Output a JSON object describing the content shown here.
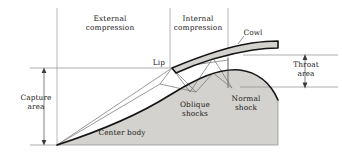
{
  "figure": {
    "type": "technical-diagram",
    "background_color": "#ffffff",
    "line_color": "#1a1a1a",
    "thin_line_color": "#6e6e6e",
    "fill_color": "#d4d2ce"
  },
  "labels": {
    "external_compression_line1": "External",
    "external_compression_line2": "compression",
    "internal_compression_line1": "Internal",
    "internal_compression_line2": "compression",
    "cowl": "Cowl",
    "lip": "Lip",
    "throat_area_line1": "Throat",
    "throat_area_line2": "area",
    "capture_area_line1": "Capture",
    "capture_area_line2": "area",
    "oblique_shocks_line1": "Oblique",
    "oblique_shocks_line2": "shocks",
    "normal_shock_line1": "Normal",
    "normal_shock_line2": "shock",
    "center_body": "Center body"
  },
  "geometry": {
    "baseline_y": 145,
    "capture_line_y": 68,
    "throat_top_y": 55,
    "throat_bottom_y": 87,
    "station_x_capture": 57,
    "station_x_lip": 170,
    "station_x_throat": 228,
    "lip_point": [
      172,
      68
    ],
    "centerbody_apex": [
      57,
      145
    ],
    "centerbody_right_edge_x": 278,
    "cowl_trailing_x": 278,
    "capture_arrow_x": 44,
    "throat_arrow_x": 305
  },
  "shock_nodes": {
    "oblique_reflections": [
      [
        172,
        68
      ],
      [
        196,
        92
      ],
      [
        213,
        73
      ],
      [
        232,
        88
      ],
      [
        213,
        73
      ],
      [
        196,
        92
      ]
    ],
    "normal_shock_x": 228,
    "normal_shock_top_y": 58,
    "normal_shock_bottom_y": 88
  }
}
